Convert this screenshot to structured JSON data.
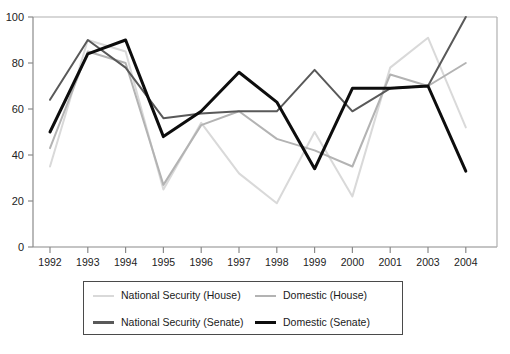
{
  "chart_data": {
    "type": "line",
    "title": "",
    "xlabel": "",
    "ylabel": "",
    "categories": [
      "1992",
      "1993",
      "1994",
      "1995",
      "1996",
      "1997",
      "1998",
      "1999",
      "2000",
      "2001",
      "2003",
      "2004"
    ],
    "ylim": [
      0,
      100
    ],
    "yticks": [
      0,
      20,
      40,
      60,
      80,
      100
    ],
    "ytick_labels": [
      "0",
      "20",
      "40",
      "60",
      "80",
      "100"
    ],
    "grid": false,
    "legend_position": "below",
    "series": [
      {
        "name": "National Security (House)",
        "color": "#d9d9d9",
        "width": 2,
        "values": [
          35,
          90,
          85,
          25,
          54,
          32,
          19,
          50,
          22,
          78,
          91,
          52
        ]
      },
      {
        "name": "Domestic (House)",
        "color": "#b3b3b3",
        "width": 2,
        "values": [
          43,
          85,
          80,
          27,
          53,
          59,
          47,
          42,
          35,
          75,
          70,
          80
        ]
      },
      {
        "name": "National Security (Senate)",
        "color": "#595959",
        "width": 2,
        "values": [
          64,
          90,
          78,
          56,
          58,
          59,
          59,
          77,
          59,
          69,
          70,
          100
        ]
      },
      {
        "name": "Domestic (Senate)",
        "color": "#0d0d0d",
        "width": 3,
        "values": [
          50,
          84,
          90,
          48,
          59,
          76,
          63,
          34,
          69,
          69,
          70,
          33
        ]
      }
    ]
  },
  "legend": {
    "entries": [
      {
        "label": "National Security (House)",
        "color": "#d9d9d9",
        "weight": "thin"
      },
      {
        "label": "Domestic (House)",
        "color": "#b3b3b3",
        "weight": "thin"
      },
      {
        "label": "National Security (Senate)",
        "color": "#595959",
        "weight": "thick"
      },
      {
        "label": "Domestic (Senate)",
        "color": "#0d0d0d",
        "weight": "thick"
      }
    ]
  }
}
